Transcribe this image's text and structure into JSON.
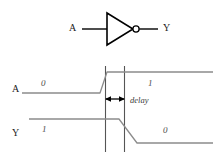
{
  "figure": {
    "type": "logic-gate-timing-diagram"
  },
  "colors": {
    "gate_stroke": "#000000",
    "wire_stroke": "#000000",
    "waveform_stroke": "#808080",
    "marker_line": "#555555",
    "arrow": "#000000",
    "text": "#1a1a1a",
    "value_text": "#4d4d4d",
    "background": "#ffffff"
  },
  "schematic": {
    "input_label": "A",
    "output_label": "Y",
    "gate_name": "inverter",
    "bubble_name": "inversion-bubble"
  },
  "timing": {
    "signals": [
      {
        "name": "A",
        "label": "A",
        "before_value": "0",
        "after_value": "1",
        "edge": "rising"
      },
      {
        "name": "Y",
        "label": "Y",
        "before_value": "1",
        "after_value": "0",
        "edge": "falling"
      }
    ],
    "annotation": {
      "label": "delay",
      "arrow_name": "delay-double-arrow"
    },
    "markers": [
      {
        "name": "input-transition-marker"
      },
      {
        "name": "output-transition-marker"
      }
    ]
  }
}
